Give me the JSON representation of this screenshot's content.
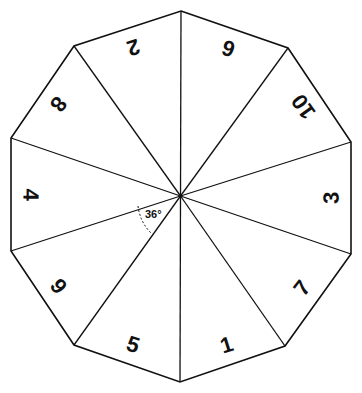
{
  "diagram": {
    "title": "",
    "shape": "regular decagon divided into 10 triangular sectors",
    "sector_numbers": [
      "6",
      "10",
      "3",
      "7",
      "1",
      "5",
      "9",
      "4",
      "8",
      "2"
    ],
    "angle_label": "36°",
    "colors": {
      "line": "#111111",
      "background": "#ffffff"
    }
  }
}
